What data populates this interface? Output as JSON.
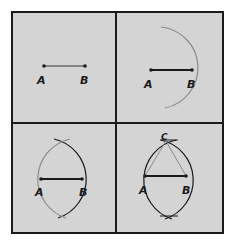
{
  "figure": {
    "colors": {
      "background": "#d4d4d4",
      "border": "#1a1a1a",
      "segment": "#1a1a1a",
      "arc": "#8a8a8a"
    },
    "panels": [
      {
        "step": 1,
        "labels": {
          "a": "A",
          "b": "B"
        }
      },
      {
        "step": 2,
        "labels": {
          "a": "A",
          "b": "B"
        }
      },
      {
        "step": 3,
        "labels": {
          "a": "A",
          "b": "B"
        }
      },
      {
        "step": 4,
        "labels": {
          "a": "A",
          "b": "B",
          "c": "C"
        }
      }
    ]
  }
}
